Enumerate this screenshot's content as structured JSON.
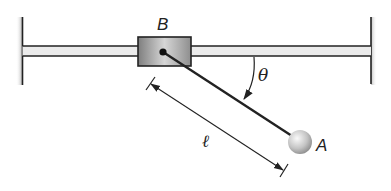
{
  "diagram": {
    "labels": {
      "block": "B",
      "ball": "A",
      "angle": "θ",
      "length": "ℓ"
    },
    "components": [
      {
        "id": "left-wall",
        "type": "fixed-support"
      },
      {
        "id": "right-wall",
        "type": "fixed-support"
      },
      {
        "id": "horizontal-rod",
        "type": "rod"
      },
      {
        "id": "slider-block",
        "type": "collar",
        "label": "B"
      },
      {
        "id": "pendulum-arm",
        "type": "link"
      },
      {
        "id": "ball",
        "type": "mass",
        "label": "A"
      },
      {
        "id": "length-dimension",
        "type": "dimension",
        "label": "ℓ"
      },
      {
        "id": "angle-arc",
        "type": "angle",
        "label": "θ"
      }
    ],
    "colors": {
      "line": "#222222",
      "block_fill_dark": "#8a8a8a",
      "block_fill_light": "#d8d8d8",
      "rod_fill": "#e6e6e6",
      "ball_light": "#f2f2f2",
      "ball_dark": "#9a9a9a"
    }
  }
}
